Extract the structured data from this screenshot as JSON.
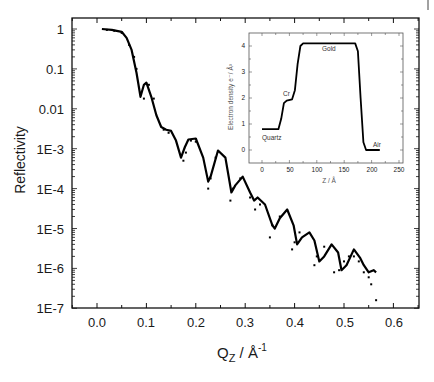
{
  "chart_data": [
    {
      "type": "line",
      "title": "",
      "xlabel": "Q_z / Å^-1",
      "ylabel": "Reflectivity",
      "xscale": "linear",
      "yscale": "log",
      "xlim": [
        -0.05,
        0.65
      ],
      "ylim": [
        1e-07,
        1.5
      ],
      "x_ticks": [
        "0.0",
        "0.1",
        "0.2",
        "0.3",
        "0.4",
        "0.5",
        "0.6"
      ],
      "y_ticks": [
        "1",
        "0.1",
        "0.01",
        "1E-3",
        "1E-4",
        "1E-5",
        "1E-6",
        "1E-7"
      ],
      "grid": false,
      "legend": null,
      "series": [
        {
          "name": "fit",
          "style": "solid",
          "x": [
            0.01,
            0.03,
            0.05,
            0.06,
            0.07,
            0.08,
            0.088,
            0.095,
            0.1,
            0.11,
            0.12,
            0.13,
            0.14,
            0.15,
            0.16,
            0.17,
            0.178,
            0.185,
            0.2,
            0.215,
            0.225,
            0.23,
            0.245,
            0.26,
            0.272,
            0.28,
            0.295,
            0.31,
            0.318,
            0.325,
            0.34,
            0.355,
            0.36,
            0.37,
            0.385,
            0.398,
            0.405,
            0.415,
            0.43,
            0.44,
            0.45,
            0.46,
            0.475,
            0.488,
            0.495,
            0.505,
            0.52,
            0.533,
            0.54,
            0.55,
            0.56,
            0.565
          ],
          "y": [
            1.0,
            0.95,
            0.85,
            0.6,
            0.3,
            0.08,
            0.02,
            0.04,
            0.045,
            0.02,
            0.007,
            0.0035,
            0.003,
            0.0028,
            0.0016,
            0.0006,
            0.0011,
            0.0017,
            0.0018,
            0.0006,
            0.00015,
            0.0002,
            0.0009,
            0.0006,
            8e-05,
            0.00012,
            0.0002,
            8e-05,
            5e-05,
            6e-05,
            4e-05,
            1.2e-05,
            1e-05,
            1.8e-05,
            3e-05,
            1.2e-05,
            4e-06,
            6e-06,
            8e-06,
            5e-06,
            1.5e-06,
            2e-06,
            4e-06,
            2.5e-06,
            9e-07,
            1.2e-06,
            3e-06,
            1.8e-06,
            1.2e-06,
            8e-07,
            9e-07,
            8e-07
          ]
        },
        {
          "name": "data",
          "style": "dotted",
          "x": [
            0.02,
            0.035,
            0.05,
            0.065,
            0.075,
            0.08,
            0.095,
            0.105,
            0.115,
            0.135,
            0.145,
            0.175,
            0.18,
            0.19,
            0.2,
            0.225,
            0.23,
            0.24,
            0.27,
            0.275,
            0.29,
            0.31,
            0.32,
            0.33,
            0.35,
            0.355,
            0.37,
            0.395,
            0.4,
            0.41,
            0.44,
            0.445,
            0.46,
            0.48,
            0.49,
            0.5,
            0.51,
            0.52,
            0.53,
            0.54,
            0.55,
            0.555,
            0.565
          ],
          "y": [
            0.95,
            0.9,
            0.8,
            0.4,
            0.2,
            0.1,
            0.018,
            0.04,
            0.018,
            0.003,
            0.0025,
            0.0005,
            0.0008,
            0.0016,
            0.0015,
            0.0001,
            0.00018,
            0.0006,
            5e-05,
            0.0001,
            0.00018,
            6e-05,
            3e-05,
            4e-05,
            6e-06,
            1.2e-05,
            2e-05,
            3e-06,
            4.5e-06,
            8e-06,
            1.2e-06,
            2e-06,
            3.5e-06,
            8e-07,
            9e-07,
            1.5e-06,
            2e-06,
            2e-06,
            1.5e-06,
            8e-07,
            6e-07,
            4e-07,
            1.6e-07
          ]
        }
      ]
    },
    {
      "type": "line",
      "role": "inset",
      "title": "",
      "xlabel": "Z / Å",
      "ylabel": "Electron density e⁻/ Å³",
      "xlim": [
        -10,
        250
      ],
      "ylim": [
        -0.4,
        4.5
      ],
      "x_ticks": [
        "0",
        "50",
        "100",
        "150",
        "200",
        "250"
      ],
      "y_ticks": [
        "0",
        "1",
        "2",
        "3",
        "4"
      ],
      "grid": false,
      "series": [
        {
          "name": "electron density profile",
          "x": [
            0,
            30,
            35,
            40,
            45,
            55,
            60,
            65,
            70,
            75,
            170,
            175,
            180,
            185,
            190,
            200,
            215
          ],
          "y": [
            0.8,
            0.8,
            1.2,
            1.8,
            1.9,
            1.95,
            2.3,
            3.3,
            4.0,
            4.1,
            4.1,
            3.8,
            2.0,
            0.3,
            0.0,
            0.0,
            0.0
          ]
        }
      ],
      "annotations": [
        {
          "text": "Quartz",
          "x": 5,
          "y": 0.55
        },
        {
          "text": "Cr",
          "x": 40,
          "y": 2.2
        },
        {
          "text": "Gold",
          "x": 120,
          "y": 3.85
        },
        {
          "text": "Air",
          "x": 200,
          "y": 0.25
        }
      ]
    }
  ],
  "labels": {
    "ylabel": "Reflectivity",
    "xlabel_main": "Q",
    "xlabel_sub": "Z",
    "xlabel_rest": " / Å",
    "xlabel_sup": "-1",
    "inset_xlabel": "Z / Å",
    "inset_ylabel": "Electron density e⁻/ Å³",
    "inset_annotations": {
      "quartz": "Quartz",
      "cr": "Cr",
      "gold": "Gold",
      "air": "Air"
    }
  },
  "ticks": {
    "x": [
      "0.0",
      "0.1",
      "0.2",
      "0.3",
      "0.4",
      "0.5",
      "0.6"
    ],
    "y": [
      "1",
      "0.1",
      "0.01",
      "1E-3",
      "1E-4",
      "1E-5",
      "1E-6",
      "1E-7"
    ],
    "inset_x": [
      "0",
      "50",
      "100",
      "150",
      "200",
      "250"
    ],
    "inset_y": [
      "4",
      "3",
      "2",
      "1",
      "0"
    ]
  }
}
